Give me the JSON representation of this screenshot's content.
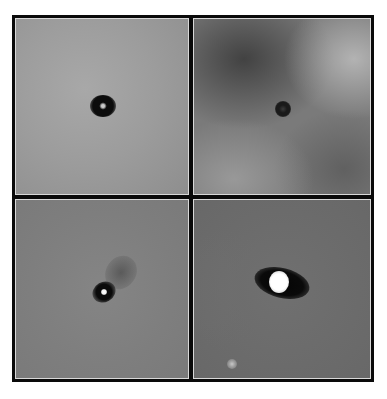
{
  "figure": {
    "layout": "2x2 grid of grayscale astronomical image panels",
    "panels": [
      {
        "position": "top-left",
        "background": "#9a9a9a",
        "source": {
          "shape": "dark ring",
          "color": "#0c0c0c",
          "center": [
            88,
            88
          ],
          "core_color": "#b8b8b8"
        }
      },
      {
        "position": "top-right",
        "background": "#6e6e6e",
        "nebulosity": "mottled dark/light patches, brighter at top-right and bottom-left",
        "source": {
          "shape": "small dark ring",
          "color": "#1a1a1a",
          "center": [
            89,
            90
          ]
        }
      },
      {
        "position": "bottom-left",
        "background": "#7f7f7f",
        "source": {
          "shape": "dark blob with bright core and faint jet to upper-right",
          "color": "#0a0a0a",
          "center": [
            88,
            92
          ],
          "core_color": "#f4f4f4"
        }
      },
      {
        "position": "bottom-right",
        "background": "#6a6a6a",
        "source": {
          "shape": "bright white core with elongated dark silhouette disk",
          "color": "#0a0a0a",
          "center": [
            87,
            86
          ],
          "core_color": "#ffffff"
        },
        "secondary_source": {
          "shape": "faint point",
          "color": "#b0b0b0",
          "center": [
            38,
            164
          ]
        }
      }
    ],
    "colors": {
      "frame": "#0a0a0a",
      "panel_inner_border": "#d8d8d8",
      "page_background": "#ffffff"
    }
  }
}
